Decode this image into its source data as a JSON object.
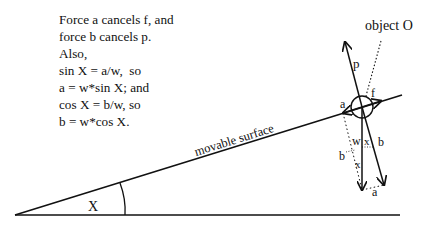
{
  "explanation": {
    "lines": [
      "Force a cancels f, and",
      "force b cancels p.",
      "Also,",
      "sin X = a/w,  so",
      "a = w*sin X; and",
      "cos X = b/w, so",
      "b = w*cos X."
    ]
  },
  "diagram": {
    "object_label": "object O",
    "surface_label": "movable surface",
    "angle_label": "X",
    "force_labels": {
      "p": "p",
      "f": "f",
      "a": "a",
      "w": "w",
      "b": "b",
      "x_upper": "x",
      "x_lower": "x",
      "b_component": "b",
      "a_component": "a"
    },
    "colors": {
      "ink": "#111111",
      "background": "#ffffff"
    }
  }
}
